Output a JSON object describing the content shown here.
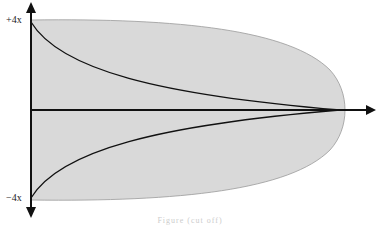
{
  "diagram": {
    "title": "",
    "axis_labels": {
      "top": "+4x",
      "bottom": "−4x"
    },
    "colors": {
      "fill": "#d9d9d9",
      "stroke": "#111111",
      "outline": "#9a9a9a"
    },
    "caption": "Figure (cut off)"
  }
}
